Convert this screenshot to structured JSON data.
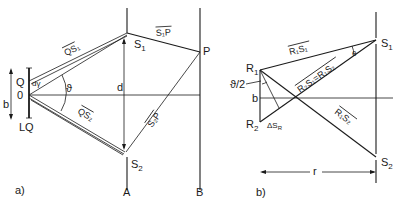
{
  "panel_a": {
    "caption": "a)",
    "labels": {
      "S1": "S",
      "S1_sub": "1",
      "S2": "S",
      "S2_sub": "2",
      "P": "P",
      "Q": "Q",
      "O": "0",
      "b": "b",
      "LQ": "LQ",
      "d": "d",
      "theta": "ϑ",
      "dphi": "dγ",
      "A": "A",
      "B": "B",
      "QS1": "QS₁",
      "QS2": "QS₂",
      "S1P": "S₁P",
      "S2P": "S₂P"
    }
  },
  "panel_b": {
    "caption": "b)",
    "labels": {
      "S1": "S",
      "S1_sub": "1",
      "S2": "S",
      "S2_sub": "2",
      "R1": "R",
      "R1_sub": "1",
      "R2": "R",
      "R2_sub": "2",
      "b": "b",
      "half_theta": "ϑ/2",
      "theta": "θ",
      "dSR": "ΔS",
      "dSR_sub": "R",
      "r": "r",
      "R1S1": "R₁S₁",
      "R2S1_eq_R1S2": "R₂S₁=R₁S₂",
      "R1S2": "R₁S₂"
    }
  }
}
